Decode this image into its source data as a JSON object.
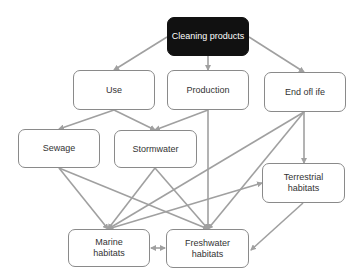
{
  "diagram": {
    "colors": {
      "edge": "#a0a0a0",
      "node_border": "#8a8a8a",
      "root_fill": "#111111",
      "root_text": "#ffffff"
    },
    "nodes": [
      {
        "id": "cleaning",
        "label": "Cleaning products",
        "x": 167,
        "y": 17,
        "w": 82,
        "h": 39,
        "dark": true
      },
      {
        "id": "use",
        "label": "Use",
        "x": 73,
        "y": 70,
        "w": 82,
        "h": 40
      },
      {
        "id": "production",
        "label": "Production",
        "x": 167,
        "y": 70,
        "w": 82,
        "h": 40
      },
      {
        "id": "endoflife",
        "label": "End ofl ife",
        "x": 264,
        "y": 72,
        "w": 82,
        "h": 40
      },
      {
        "id": "sewage",
        "label": "Sewage",
        "x": 18,
        "y": 129,
        "w": 82,
        "h": 39
      },
      {
        "id": "stormwater",
        "label": "Stormwater",
        "x": 114,
        "y": 130,
        "w": 83,
        "h": 38
      },
      {
        "id": "terrestrial",
        "label": "Terrestrial\nhabitats",
        "x": 262,
        "y": 163,
        "w": 83,
        "h": 40
      },
      {
        "id": "marine",
        "label": "Marine\nhabitats",
        "x": 68,
        "y": 229,
        "w": 82,
        "h": 38
      },
      {
        "id": "freshwater",
        "label": "Freshwater\nhabitats",
        "x": 166,
        "y": 229,
        "w": 83,
        "h": 39
      }
    ],
    "edges": [
      {
        "from": "cleaning",
        "to": "use",
        "points": [
          [
            167,
            37
          ],
          [
            114,
            70
          ]
        ]
      },
      {
        "from": "cleaning",
        "to": "production",
        "points": [
          [
            208,
            56
          ],
          [
            208,
            70
          ]
        ]
      },
      {
        "from": "cleaning",
        "to": "endoflife",
        "points": [
          [
            249,
            37
          ],
          [
            304,
            72
          ]
        ]
      },
      {
        "from": "use",
        "to": "sewage",
        "points": [
          [
            114,
            110
          ],
          [
            59,
            129
          ]
        ]
      },
      {
        "from": "use",
        "to": "stormwater",
        "points": [
          [
            114,
            110
          ],
          [
            155,
            130
          ]
        ]
      },
      {
        "from": "production",
        "to": "stormwater",
        "points": [
          [
            208,
            110
          ],
          [
            155,
            130
          ]
        ]
      },
      {
        "from": "production",
        "to": "freshwater",
        "points": [
          [
            208,
            110
          ],
          [
            208,
            229
          ]
        ]
      },
      {
        "from": "endoflife",
        "to": "terrestrial",
        "points": [
          [
            304,
            112
          ],
          [
            304,
            163
          ]
        ]
      },
      {
        "from": "endoflife",
        "to": "marine",
        "points": [
          [
            304,
            112
          ],
          [
            108,
            229
          ]
        ]
      },
      {
        "from": "endoflife",
        "to": "freshwater",
        "points": [
          [
            304,
            112
          ],
          [
            208,
            229
          ]
        ]
      },
      {
        "from": "sewage",
        "to": "marine",
        "points": [
          [
            59,
            168
          ],
          [
            108,
            229
          ]
        ]
      },
      {
        "from": "sewage",
        "to": "freshwater",
        "points": [
          [
            59,
            168
          ],
          [
            208,
            229
          ]
        ]
      },
      {
        "from": "stormwater",
        "to": "marine",
        "points": [
          [
            155,
            168
          ],
          [
            108,
            229
          ]
        ]
      },
      {
        "from": "stormwater",
        "to": "freshwater",
        "points": [
          [
            155,
            168
          ],
          [
            208,
            229
          ]
        ]
      },
      {
        "from": "marine",
        "to": "terrestrial",
        "points": [
          [
            108,
            229
          ],
          [
            262,
            183
          ]
        ]
      },
      {
        "from": "terrestrial",
        "to": "freshwater",
        "points": [
          [
            303,
            203
          ],
          [
            251,
            250
          ]
        ]
      },
      {
        "from": "marine",
        "to": "freshwater",
        "points": [
          [
            151,
            248
          ],
          [
            165,
            248
          ]
        ],
        "bidirectional": true
      }
    ]
  }
}
